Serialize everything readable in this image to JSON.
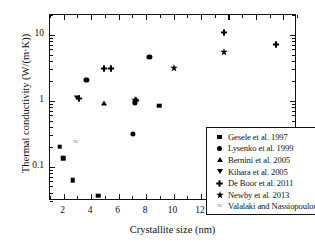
{
  "chart_data": {
    "type": "scatter",
    "title": "",
    "xlabel": "Crystallite size (nm)",
    "ylabel": "Thermal conductivity (W/(m·K))",
    "xlim": [
      1.0,
      19.0
    ],
    "ylim": [
      0.03,
      20.0
    ],
    "yscale": "log",
    "xscale": "linear",
    "grid": false,
    "legend_position": "lower right",
    "xticks": [
      2,
      4,
      6,
      8,
      10,
      12,
      14,
      16,
      18
    ],
    "xtick_labels": [
      "2",
      "4",
      "6",
      "8",
      "10",
      "12",
      "14",
      "16",
      "18"
    ],
    "yticks": [
      0.1,
      1,
      10
    ],
    "ytick_labels": [
      "0.1",
      "1",
      "10"
    ],
    "series": [
      {
        "name": "Gesele et al. 1997",
        "marker": "square",
        "points": [
          {
            "x": 1.7,
            "y": 0.2
          },
          {
            "x": 1.95,
            "y": 0.135
          },
          {
            "x": 2.65,
            "y": 0.062
          },
          {
            "x": 4.5,
            "y": 0.036
          },
          {
            "x": 8.95,
            "y": 0.84
          }
        ]
      },
      {
        "name": "Lysenko et al. 1999",
        "marker": "circle",
        "points": [
          {
            "x": 3.65,
            "y": 2.05
          },
          {
            "x": 7.05,
            "y": 0.31
          },
          {
            "x": 7.2,
            "y": 0.94
          },
          {
            "x": 8.25,
            "y": 4.6
          }
        ]
      },
      {
        "name": "Bernini et al. 2005",
        "marker": "triangle-up",
        "points": [
          {
            "x": 4.95,
            "y": 0.93
          }
        ]
      },
      {
        "name": "Kihara et al. 2005",
        "marker": "triangle-down",
        "points": [
          {
            "x": 2.95,
            "y": 1.1
          }
        ]
      },
      {
        "name": "De Boor et al. 2011",
        "marker": "plus",
        "points": [
          {
            "x": 3.1,
            "y": 1.12
          },
          {
            "x": 4.95,
            "y": 3.2
          },
          {
            "x": 5.45,
            "y": 3.2
          },
          {
            "x": 7.25,
            "y": 1.07
          },
          {
            "x": 13.7,
            "y": 11.5
          },
          {
            "x": 17.5,
            "y": 7.4
          }
        ]
      },
      {
        "name": "Newby et al. 2013",
        "marker": "star",
        "points": [
          {
            "x": 7.2,
            "y": 1.07
          },
          {
            "x": 10.0,
            "y": 3.2
          },
          {
            "x": 13.7,
            "y": 5.7
          }
        ]
      },
      {
        "name": "Valalaki and Nassiopoulou 2013",
        "marker": "tilde",
        "points": [
          {
            "x": 2.85,
            "y": 0.235
          }
        ]
      }
    ],
    "legend_entries": [
      {
        "label": "Gesele et al. 1997",
        "marker": "square"
      },
      {
        "label": "Lysenko et al. 1999",
        "marker": "circle"
      },
      {
        "label": "Bernini et al. 2005",
        "marker": "triangle-up"
      },
      {
        "label": "Kihara et al. 2005",
        "marker": "triangle-down"
      },
      {
        "label": "De Boor et al. 2011",
        "marker": "plus"
      },
      {
        "label": "Newby et al. 2013",
        "marker": "star"
      },
      {
        "label": "Valalaki and Nassiopoulou 2013",
        "marker": "tilde"
      }
    ],
    "colors": {
      "marker": "#000000",
      "axis": "#111111",
      "background": "#ffffff"
    }
  }
}
